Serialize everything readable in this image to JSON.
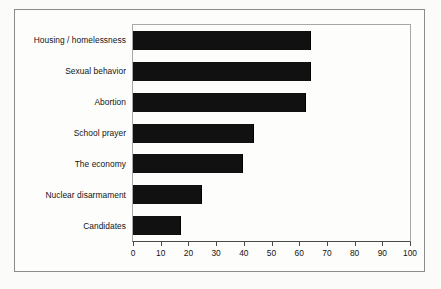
{
  "chart_data": {
    "type": "bar",
    "orientation": "horizontal",
    "title": "",
    "xlabel": "",
    "ylabel": "",
    "xlim": [
      0,
      100
    ],
    "xticks": [
      "0",
      "10",
      "20",
      "30",
      "40",
      "50",
      "60",
      "70",
      "80",
      "90",
      "100"
    ],
    "grid": false,
    "legend": null,
    "bar_color": "#111111",
    "categories": [
      "Housing / homelessness",
      "Sexual behavior",
      "Abortion",
      "School prayer",
      "The economy",
      "Nuclear disarmament",
      "Candidates"
    ],
    "values": [
      64,
      64,
      62,
      43.5,
      39.5,
      24.5,
      17
    ]
  },
  "caption": {
    "text": ""
  }
}
